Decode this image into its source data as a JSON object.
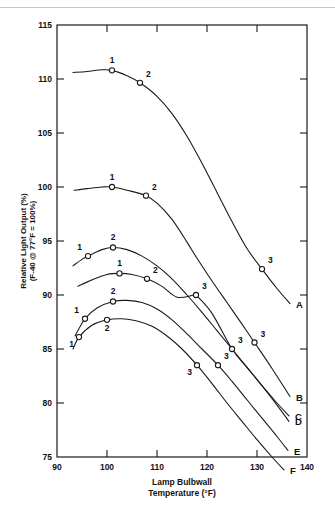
{
  "chart_data": {
    "type": "line",
    "title": "",
    "xlabel": "Lamp Bulbwall Temperature (°F)",
    "xlabel_line1": "Lamp Bulbwall",
    "xlabel_line2": "Temperature (°F)",
    "ylabel_line1": "Relative Light Output (%)",
    "ylabel_line2": "(F-40 @ 77°F = 100%)",
    "xlim": [
      90,
      140
    ],
    "ylim": [
      75,
      115
    ],
    "xticks": [
      90,
      100,
      110,
      120,
      130,
      140
    ],
    "xtick_labels": [
      "90",
      "100",
      "110",
      "120",
      "130",
      "140"
    ],
    "yticks": [
      75,
      80,
      85,
      90,
      95,
      100,
      105,
      110,
      115
    ],
    "ytick_labels": [
      "75",
      "80",
      "85",
      "90",
      "95",
      "100",
      "105",
      "110",
      "115"
    ],
    "grid": false,
    "legend": "curve-end-labels",
    "line_color": "#1a1a1a",
    "marker_style": "open-circle",
    "series": [
      {
        "name": "A",
        "end_label": "A",
        "path": [
          [
            93.2,
            110.6
          ],
          [
            96.0,
            110.7
          ],
          [
            99.0,
            110.85
          ],
          [
            101.0,
            110.8
          ],
          [
            104.0,
            110.3
          ],
          [
            106.6,
            109.65
          ],
          [
            110.0,
            108.4
          ],
          [
            113.0,
            106.8
          ],
          [
            116.0,
            104.7
          ],
          [
            119.0,
            102.2
          ],
          [
            122.0,
            99.5
          ],
          [
            125.0,
            96.8
          ],
          [
            128.0,
            94.3
          ],
          [
            131.0,
            92.4
          ],
          [
            134.0,
            90.6
          ],
          [
            136.6,
            89.2
          ]
        ],
        "points": [
          {
            "label": "1",
            "x": 101.0,
            "y": 110.8,
            "label_pos": "above"
          },
          {
            "label": "2",
            "x": 106.6,
            "y": 109.65,
            "label_pos": "above-right"
          },
          {
            "label": "3",
            "x": 131.0,
            "y": 92.4,
            "label_pos": "above-right"
          }
        ]
      },
      {
        "name": "B",
        "end_label": "B",
        "path": [
          [
            93.4,
            99.7
          ],
          [
            96.0,
            99.85
          ],
          [
            99.0,
            100.0
          ],
          [
            101.0,
            100.0
          ],
          [
            104.0,
            99.7
          ],
          [
            107.8,
            99.2
          ],
          [
            110.0,
            98.5
          ],
          [
            113.0,
            97.0
          ],
          [
            116.0,
            94.9
          ],
          [
            118.0,
            93.4
          ],
          [
            121.0,
            91.3
          ],
          [
            124.0,
            89.3
          ],
          [
            127.0,
            87.3
          ],
          [
            129.5,
            85.6
          ],
          [
            133.0,
            83.2
          ],
          [
            136.6,
            80.6
          ]
        ],
        "points": [
          {
            "label": "1",
            "x": 101.0,
            "y": 100.0,
            "label_pos": "above"
          },
          {
            "label": "2",
            "x": 107.8,
            "y": 99.2,
            "label_pos": "above-right"
          },
          {
            "label": "3",
            "x": 129.5,
            "y": 85.6,
            "label_pos": "above-right"
          }
        ]
      },
      {
        "name": "C",
        "end_label": "C",
        "path": [
          [
            93.2,
            92.7
          ],
          [
            95.0,
            93.3
          ],
          [
            96.2,
            93.6
          ],
          [
            99.0,
            94.2
          ],
          [
            101.2,
            94.4
          ],
          [
            104.0,
            94.2
          ],
          [
            107.0,
            93.6
          ],
          [
            110.0,
            92.7
          ],
          [
            113.0,
            91.5
          ],
          [
            116.0,
            90.0
          ],
          [
            119.0,
            88.4
          ],
          [
            122.0,
            86.7
          ],
          [
            125.0,
            85.0
          ],
          [
            128.0,
            83.3
          ],
          [
            131.0,
            81.6
          ],
          [
            134.0,
            80.0
          ],
          [
            136.4,
            78.8
          ]
        ],
        "points": [
          {
            "label": "1",
            "x": 96.2,
            "y": 93.6,
            "label_pos": "above-left"
          },
          {
            "label": "2",
            "x": 101.2,
            "y": 94.4,
            "label_pos": "above"
          }
        ]
      },
      {
        "name": "D",
        "end_label": "D",
        "path": [
          [
            94.2,
            90.8
          ],
          [
            97.0,
            91.4
          ],
          [
            100.0,
            91.9
          ],
          [
            102.5,
            92.0
          ],
          [
            105.0,
            91.9
          ],
          [
            108.0,
            91.5
          ],
          [
            111.0,
            90.8
          ],
          [
            114.0,
            89.8
          ],
          [
            117.5,
            90.0
          ],
          [
            118.0,
            89.9
          ],
          [
            121.0,
            88.3
          ],
          [
            125.0,
            85.0
          ],
          [
            128.0,
            83.3
          ],
          [
            131.0,
            81.6
          ],
          [
            134.0,
            79.8
          ],
          [
            136.4,
            78.3
          ]
        ],
        "points": [
          {
            "label": "1",
            "x": 102.5,
            "y": 92.0,
            "label_pos": "above"
          },
          {
            "label": "2",
            "x": 108.0,
            "y": 91.5,
            "label_pos": "above-right"
          },
          {
            "label": "3",
            "x": 117.8,
            "y": 90.0,
            "label_pos": "above-right"
          },
          {
            "label": "3b",
            "x": 125.0,
            "y": 85.0,
            "label_pos": "above-right"
          }
        ]
      },
      {
        "name": "E",
        "end_label": "E",
        "path": [
          [
            93.6,
            86.2
          ],
          [
            95.6,
            87.8
          ],
          [
            98.0,
            88.8
          ],
          [
            101.2,
            89.4
          ],
          [
            104.0,
            89.5
          ],
          [
            107.0,
            89.3
          ],
          [
            110.0,
            88.7
          ],
          [
            113.0,
            87.7
          ],
          [
            116.0,
            86.4
          ],
          [
            119.0,
            85.0
          ],
          [
            122.2,
            83.5
          ],
          [
            125.0,
            82.0
          ],
          [
            128.0,
            80.3
          ],
          [
            131.0,
            78.6
          ],
          [
            134.0,
            76.9
          ],
          [
            136.2,
            75.6
          ]
        ],
        "points": [
          {
            "label": "1",
            "x": 95.6,
            "y": 87.8,
            "label_pos": "above-left"
          },
          {
            "label": "2",
            "x": 101.2,
            "y": 89.4,
            "label_pos": "above"
          },
          {
            "label": "3",
            "x": 122.2,
            "y": 83.5,
            "label_pos": "above-right"
          }
        ]
      },
      {
        "name": "F",
        "end_label": "F",
        "path": [
          [
            93.2,
            85.0
          ],
          [
            94.4,
            86.1
          ],
          [
            97.0,
            87.2
          ],
          [
            100.0,
            87.7
          ],
          [
            103.0,
            87.8
          ],
          [
            106.0,
            87.6
          ],
          [
            109.0,
            87.1
          ],
          [
            112.0,
            86.2
          ],
          [
            115.0,
            85.0
          ],
          [
            118.0,
            83.5
          ],
          [
            121.0,
            81.8
          ],
          [
            124.0,
            80.0
          ],
          [
            127.0,
            78.3
          ],
          [
            130.0,
            76.6
          ],
          [
            133.0,
            75.0
          ],
          [
            135.4,
            73.8
          ]
        ],
        "points": [
          {
            "label": "1",
            "x": 94.4,
            "y": 86.1,
            "label_pos": "below-left"
          },
          {
            "label": "2",
            "x": 100.0,
            "y": 87.7,
            "label_pos": "below"
          },
          {
            "label": "3",
            "x": 118.0,
            "y": 83.5,
            "label_pos": "below-left"
          }
        ]
      }
    ]
  },
  "figure": {
    "alt": "Relative light output versus lamp bulbwall temperature curves A through F"
  }
}
